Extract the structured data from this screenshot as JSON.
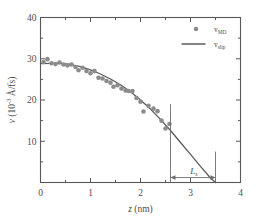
{
  "chart_data": {
    "type": "scatter",
    "title": "",
    "xlabel": "z (nm)",
    "xlabel_symbol": "z",
    "xlabel_unit": "(nm)",
    "ylabel": "v (10-3 A/fs)",
    "ylabel_symbol": "v",
    "ylabel_unit_pre": "(10",
    "ylabel_unit_exp": "-3",
    "ylabel_unit_post": " Å/fs)",
    "xlim": [
      0,
      4
    ],
    "ylim": [
      0,
      40
    ],
    "xticks": [
      0,
      1,
      2,
      3,
      4
    ],
    "xticklabels": [
      "0",
      "1",
      "2",
      "3",
      "4"
    ],
    "yticks": [
      0,
      10,
      20,
      30,
      40
    ],
    "yticklabels": [
      "0",
      "10",
      "20",
      "30",
      "40"
    ],
    "x_minor_ticks": [
      0.5,
      1.5,
      2.5,
      3.5
    ],
    "y_minor_ticks": [
      5,
      15,
      25,
      35
    ],
    "grid": false,
    "legend_position": "upper right",
    "series": [
      {
        "name": "v_MD",
        "label_base": "v",
        "label_sub": "MD",
        "type": "scatter",
        "marker": "circle",
        "color": "#8c8c8c",
        "points": [
          [
            0.06,
            29.2
          ],
          [
            0.14,
            29.9
          ],
          [
            0.22,
            28.9
          ],
          [
            0.3,
            28.7
          ],
          [
            0.38,
            29.1
          ],
          [
            0.46,
            28.6
          ],
          [
            0.54,
            28.4
          ],
          [
            0.62,
            28.6
          ],
          [
            0.7,
            28.0
          ],
          [
            0.76,
            27.2
          ],
          [
            0.84,
            27.8
          ],
          [
            0.92,
            27.0
          ],
          [
            1.0,
            26.5
          ],
          [
            1.08,
            27.0
          ],
          [
            1.16,
            25.4
          ],
          [
            1.24,
            25.2
          ],
          [
            1.32,
            24.6
          ],
          [
            1.4,
            24.2
          ],
          [
            1.46,
            23.2
          ],
          [
            1.54,
            23.6
          ],
          [
            1.62,
            22.8
          ],
          [
            1.7,
            22.3
          ],
          [
            1.76,
            22.2
          ],
          [
            1.84,
            22.2
          ],
          [
            1.92,
            20.5
          ],
          [
            2.0,
            19.6
          ],
          [
            2.06,
            17.2
          ],
          [
            2.16,
            18.6
          ],
          [
            2.26,
            17.9
          ],
          [
            2.34,
            17.3
          ],
          [
            2.42,
            15.0
          ],
          [
            2.5,
            13.1
          ],
          [
            2.58,
            14.2
          ]
        ]
      },
      {
        "name": "v_slip",
        "label_base": "v",
        "label_sub": "slip",
        "type": "line",
        "color": "#5b5b5b",
        "curve": [
          [
            0.0,
            28.8
          ],
          [
            0.2,
            28.9
          ],
          [
            0.4,
            28.9
          ],
          [
            0.6,
            28.6
          ],
          [
            0.8,
            28.1
          ],
          [
            1.0,
            27.3
          ],
          [
            1.2,
            26.3
          ],
          [
            1.4,
            25.1
          ],
          [
            1.6,
            23.7
          ],
          [
            1.8,
            22.0
          ],
          [
            2.0,
            20.0
          ],
          [
            2.2,
            17.8
          ],
          [
            2.4,
            15.3
          ],
          [
            2.6,
            12.6
          ],
          [
            2.8,
            9.7
          ],
          [
            3.0,
            6.8
          ],
          [
            3.2,
            3.9
          ],
          [
            3.4,
            1.1
          ],
          [
            3.5,
            0.0
          ]
        ]
      }
    ],
    "annotations": [
      {
        "name": "wall-position-vline",
        "type": "vline",
        "x": 2.6,
        "y_from": 0,
        "y_to": 19.0
      },
      {
        "name": "extrapolation-vline",
        "type": "vline",
        "x": 3.5,
        "y_from": 0,
        "y_to": 7.5
      },
      {
        "name": "slip-length-arrow",
        "type": "double-arrow",
        "x_from": 2.6,
        "x_to": 3.5,
        "y": 1.2,
        "label_base": "L",
        "label_sub": "s"
      }
    ]
  },
  "legend": {
    "entries": [
      {
        "symbol": "marker",
        "base": "v",
        "sub": "MD"
      },
      {
        "symbol": "line",
        "base": "v",
        "sub": "slip"
      }
    ]
  }
}
